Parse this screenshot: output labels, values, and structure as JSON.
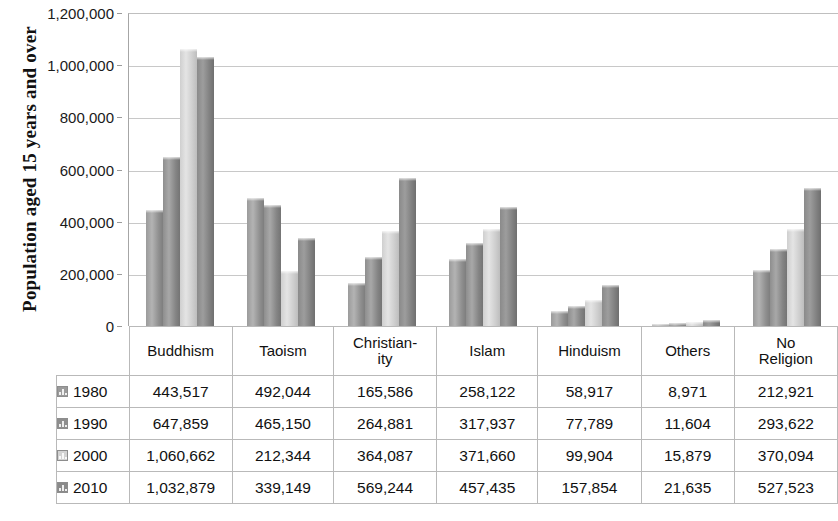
{
  "chart_data": {
    "type": "bar",
    "title": "",
    "xlabel": "",
    "ylabel": "Population  aged 15 years and over",
    "ylim": [
      0,
      1200000
    ],
    "ytick_values": [
      0,
      200000,
      400000,
      600000,
      800000,
      1000000,
      1200000
    ],
    "ytick_labels": [
      "0",
      "200,000",
      "400,000",
      "600,000",
      "800,000",
      "1,000,000",
      "1,200,000"
    ],
    "grid": true,
    "legend_position": "table-row-headers",
    "categories": [
      "Buddhism",
      "Taoism",
      "Christian-\nity",
      "Islam",
      "Hinduism",
      "Others",
      "No\nReligion"
    ],
    "series": [
      {
        "name": "1980",
        "color": "#9b9b9b",
        "values": [
          443517,
          492044,
          165586,
          258122,
          58917,
          8971,
          212921
        ]
      },
      {
        "name": "1990",
        "color": "#8e8e8e",
        "values": [
          647859,
          465150,
          264881,
          317937,
          77789,
          11604,
          293622
        ]
      },
      {
        "name": "2000",
        "color": "#d2d2d2",
        "values": [
          1060662,
          212344,
          364087,
          371660,
          99904,
          15879,
          370094
        ]
      },
      {
        "name": "2010",
        "color": "#8a8a8a",
        "values": [
          1032879,
          339149,
          569244,
          457435,
          157854,
          21635,
          527523
        ]
      }
    ]
  },
  "data_table": {
    "category_row": [
      "Buddhism",
      "Taoism",
      "Christian-ity",
      "Islam",
      "Hinduism",
      "Others",
      "No Religion"
    ],
    "rows": [
      {
        "label": "1980",
        "swatch": "series-swatch-1980",
        "cells": [
          "443,517",
          "492,044",
          "165,586",
          "258,122",
          "58,917",
          "8,971",
          "212,921"
        ]
      },
      {
        "label": "1990",
        "swatch": "series-swatch-1990",
        "cells": [
          "647,859",
          "465,150",
          "264,881",
          "317,937",
          "77,789",
          "11,604",
          "293,622"
        ]
      },
      {
        "label": "2000",
        "swatch": "series-swatch-2000",
        "cells": [
          "1,060,662",
          "212,344",
          "364,087",
          "371,660",
          "99,904",
          "15,879",
          "370,094"
        ]
      },
      {
        "label": "2010",
        "swatch": "series-swatch-2010",
        "cells": [
          "1,032,879",
          "339,149",
          "569,244",
          "457,435",
          "157,854",
          "21,635",
          "527,523"
        ]
      }
    ]
  }
}
